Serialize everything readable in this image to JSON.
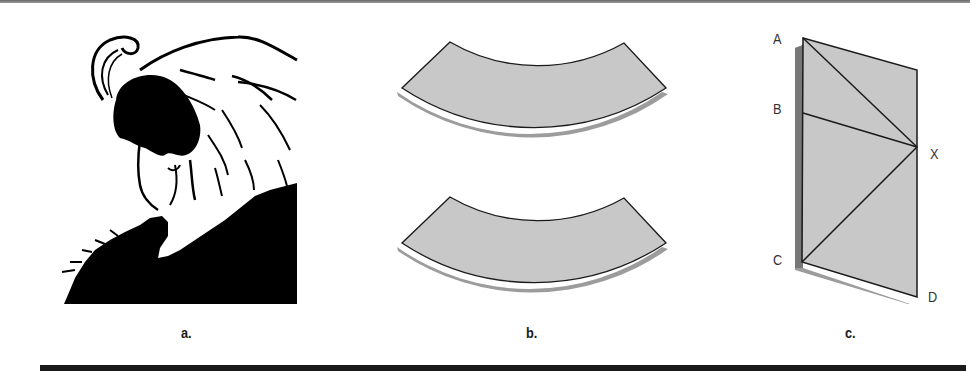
{
  "figure": {
    "panels": [
      {
        "id": "a",
        "label": "a.",
        "content": "ambiguous figure: young woman / old woman illusion"
      },
      {
        "id": "b",
        "label": "b.",
        "content": "two identical curved arc shapes (Jastrow illusion)"
      },
      {
        "id": "c",
        "label": "c.",
        "content": "parallelogram with diagonals AX and CX (Sander illusion)"
      }
    ],
    "points": {
      "A": "A",
      "B": "B",
      "X": "X",
      "C": "C",
      "D": "D"
    },
    "colors": {
      "fill": "#c8c8c8",
      "shadow": "#9c9c9c",
      "stroke": "#1a1a1a",
      "ink": "#000000",
      "bottom_bar": "#1a1a1a"
    }
  }
}
